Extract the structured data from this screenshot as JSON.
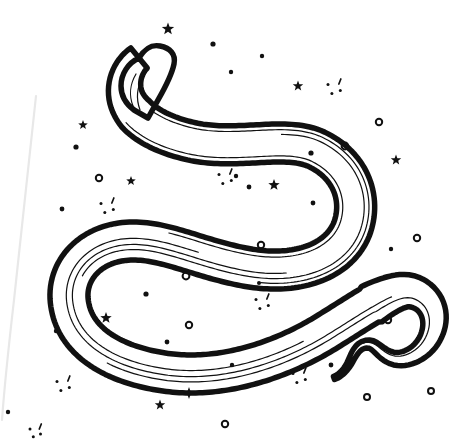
{
  "artwork": {
    "title": "Celestial Snake Line Art",
    "subject": "snake",
    "style": "hand-drawn ink line art",
    "background_color": "#ffffff",
    "ink_color": "#111111",
    "paper_edge_color": "#e8e8e8",
    "canvas": {
      "width": 470,
      "height": 441
    },
    "description": "A long serpent drawn in a sweeping S-curve with a blunt rounded head at upper-left and a thin wavy tail at lower-right, surrounded by scattered stars, dots, rings and sparkles."
  },
  "snake": {
    "name": "snake",
    "outline_stroke_width": 5.5,
    "inner_stroke_width": 1.2,
    "spine_path": "M 139 58 C 124 70, 120 92, 131 108 C 140 122, 160 134, 190 141 C 238 152, 286 134, 318 150 C 352 167, 362 200, 352 228 C 340 260, 300 276, 250 268 C 196 259, 160 236, 120 242 C 84 248, 64 276, 70 306 C 76 340, 110 364, 164 372 C 224 381, 286 358, 330 330 C 372 304, 396 286, 414 292 C 432 298, 440 318, 430 338 C 422 354, 404 362, 392 358 C 380 354, 376 344, 368 344 C 358 344, 354 354, 350 362 C 346 370, 340 376, 334 378",
    "body_bands": [
      -17,
      -11.5,
      -6,
      0,
      6,
      11.5,
      17
    ],
    "head": {
      "name": "head",
      "outline": "M 139 58 C 128 63, 121 74, 121 86 C 121 96, 126 104, 134 110 L 148 118 L 158 100 C 166 86, 172 74, 174 64 C 176 54, 170 48, 160 46 C 150 44, 144 50, 139 58 Z"
    },
    "tail": {
      "name": "tail",
      "taper_from": 0.82,
      "tip_point": [
        334,
        378
      ]
    }
  },
  "decorations": {
    "label": "celestial sparkles",
    "stars5": [
      {
        "x": 168,
        "y": 29,
        "r": 6.5
      },
      {
        "x": 83,
        "y": 125,
        "r": 5.0
      },
      {
        "x": 131,
        "y": 181,
        "r": 5.0
      },
      {
        "x": 274,
        "y": 185,
        "r": 6.0
      },
      {
        "x": 298,
        "y": 86,
        "r": 5.5
      },
      {
        "x": 396,
        "y": 160,
        "r": 5.5
      },
      {
        "x": 106,
        "y": 318,
        "r": 6.0
      },
      {
        "x": 160,
        "y": 405,
        "r": 5.5
      }
    ],
    "dots": [
      {
        "x": 213,
        "y": 44,
        "r": 2.6
      },
      {
        "x": 231,
        "y": 72,
        "r": 2.2
      },
      {
        "x": 262,
        "y": 56,
        "r": 2.2
      },
      {
        "x": 76,
        "y": 147,
        "r": 2.6
      },
      {
        "x": 236,
        "y": 176,
        "r": 2.2
      },
      {
        "x": 249,
        "y": 187,
        "r": 2.4
      },
      {
        "x": 311,
        "y": 153,
        "r": 2.6
      },
      {
        "x": 313,
        "y": 203,
        "r": 2.4
      },
      {
        "x": 62,
        "y": 209,
        "r": 2.4
      },
      {
        "x": 146,
        "y": 294,
        "r": 2.6
      },
      {
        "x": 167,
        "y": 342,
        "r": 2.4
      },
      {
        "x": 232,
        "y": 365,
        "r": 2.2
      },
      {
        "x": 56,
        "y": 331,
        "r": 2.2
      },
      {
        "x": 391,
        "y": 249,
        "r": 2.2
      },
      {
        "x": 342,
        "y": 482,
        "r": 2.0
      },
      {
        "x": 331,
        "y": 365,
        "r": 2.4
      },
      {
        "x": 8,
        "y": 412,
        "r": 2.2
      },
      {
        "x": 259,
        "y": 283,
        "r": 2.0
      }
    ],
    "rings": [
      {
        "x": 99,
        "y": 178,
        "r": 3.2
      },
      {
        "x": 379,
        "y": 122,
        "r": 3.2
      },
      {
        "x": 417,
        "y": 238,
        "r": 3.2
      },
      {
        "x": 345,
        "y": 146,
        "r": 3.4
      },
      {
        "x": 261,
        "y": 245,
        "r": 3.2
      },
      {
        "x": 186,
        "y": 276,
        "r": 3.4
      },
      {
        "x": 189,
        "y": 325,
        "r": 3.2
      },
      {
        "x": 388,
        "y": 320,
        "r": 3.2
      },
      {
        "x": 225,
        "y": 424,
        "r": 3.2
      },
      {
        "x": 367,
        "y": 397,
        "r": 3.0
      },
      {
        "x": 431,
        "y": 391,
        "r": 3.0
      }
    ],
    "sparkles": [
      {
        "x": 335,
        "y": 88,
        "s": 7
      },
      {
        "x": 226,
        "y": 178,
        "s": 7
      },
      {
        "x": 108,
        "y": 207,
        "s": 7
      },
      {
        "x": 263,
        "y": 303,
        "s": 7
      },
      {
        "x": 64,
        "y": 385,
        "s": 7
      },
      {
        "x": 300,
        "y": 377,
        "s": 7
      },
      {
        "x": 36,
        "y": 432,
        "s": 6
      }
    ],
    "cross_stars": [
      {
        "x": 189,
        "y": 393,
        "r": 6.0
      }
    ]
  }
}
